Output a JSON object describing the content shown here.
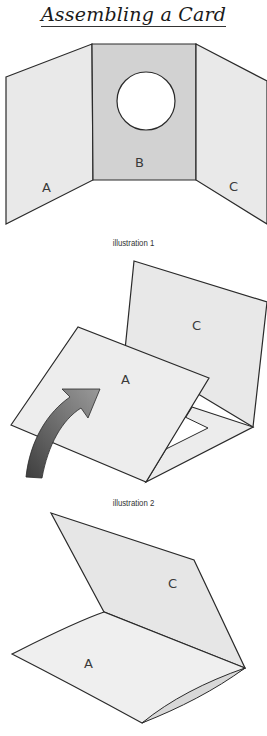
{
  "title": "Assembling a Card",
  "colors": {
    "panel_light": "#ebebeb",
    "panel_mid": "#d4d4d4",
    "outline": "#2a2a2a",
    "arrow_dark": "#4a4a4a",
    "arrow_light": "#8a8a8a",
    "background": "#ffffff"
  },
  "illustrations": [
    {
      "caption": "illustration 1",
      "panels": [
        {
          "label": "A",
          "description": "left panel"
        },
        {
          "label": "B",
          "description": "center panel with circular window cut-out"
        },
        {
          "label": "C",
          "description": "right panel"
        }
      ]
    },
    {
      "caption": "illustration 2",
      "panels": [
        {
          "label": "C",
          "description": "standing back panel"
        },
        {
          "label": "A",
          "description": "panel folding over with curved arrow"
        }
      ]
    },
    {
      "caption": "",
      "panels": [
        {
          "label": "C",
          "description": "upper folded panel"
        },
        {
          "label": "A",
          "description": "lower folded panel"
        }
      ]
    }
  ]
}
